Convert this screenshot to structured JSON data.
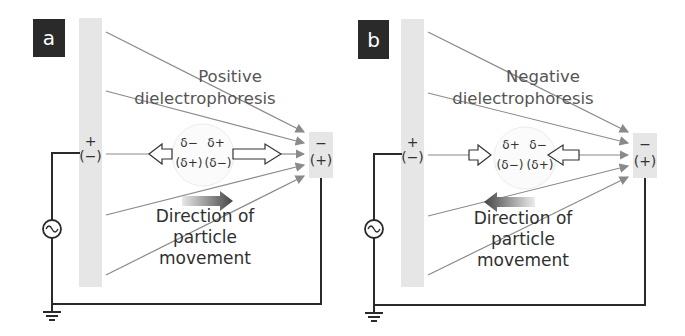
{
  "panels": [
    {
      "label": "a",
      "title_line1": "Positive",
      "title_line2": "dielectrophoresis",
      "left_electrode": {
        "top": "+",
        "bottom": "(−)"
      },
      "right_electrode": {
        "top": "−",
        "bottom": "(+)"
      },
      "particle": {
        "top_left": "δ−",
        "top_right": "δ+",
        "bottom_left": "(δ+)",
        "bottom_right": "(δ−)"
      },
      "movement_line1": "Direction of",
      "movement_line2": "particle",
      "movement_line3": "movement",
      "movement_direction": "right"
    },
    {
      "label": "b",
      "title_line1": "Negative",
      "title_line2": "dielectrophoresis",
      "left_electrode": {
        "top": "+",
        "bottom": "(−)"
      },
      "right_electrode": {
        "top": "−",
        "bottom": "(+)"
      },
      "particle": {
        "top_left": "δ+",
        "top_right": "δ−",
        "bottom_left": "(δ−)",
        "bottom_right": "(δ+)"
      },
      "movement_line1": "Direction of",
      "movement_line2": "particle",
      "movement_line3": "movement",
      "movement_direction": "left"
    }
  ],
  "colors": {
    "label_bg": "#2a2a2a",
    "electrode": "#e6e6e6",
    "field_line": "#8a8a8a",
    "wire": "#2a2a2a"
  }
}
